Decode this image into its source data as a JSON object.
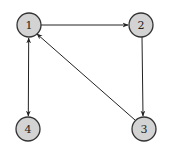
{
  "diagram": {
    "type": "directed-graph",
    "node_fill": "#d3d3d3",
    "node_stroke": "#333333",
    "edge_color": "#222222",
    "nodes": [
      {
        "id": "1",
        "label": "1",
        "x": 29,
        "y": 25
      },
      {
        "id": "2",
        "label": "2",
        "x": 141,
        "y": 25
      },
      {
        "id": "3",
        "label": "3",
        "x": 144,
        "y": 129
      },
      {
        "id": "4",
        "label": "4",
        "x": 28,
        "y": 129
      }
    ],
    "edges": [
      {
        "from": "1",
        "to": "2",
        "bidirectional": false
      },
      {
        "from": "2",
        "to": "3",
        "bidirectional": false
      },
      {
        "from": "3",
        "to": "1",
        "bidirectional": false
      },
      {
        "from": "1",
        "to": "4",
        "bidirectional": true
      }
    ]
  }
}
